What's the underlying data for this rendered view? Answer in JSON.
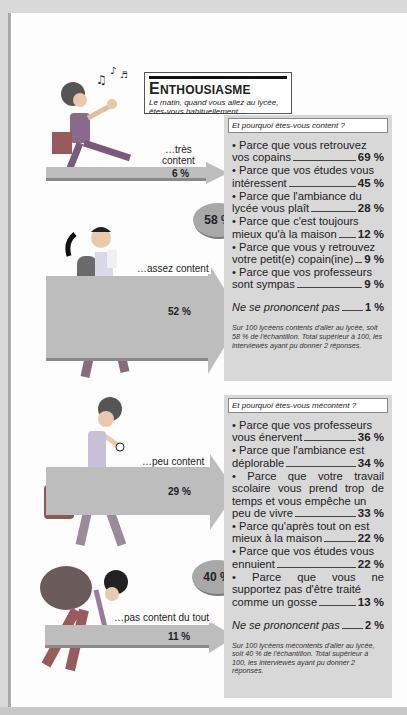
{
  "header": {
    "title_initial": "E",
    "title_rest": "NTHOUSIASME",
    "subtitle": "Le matin, quand vous allez au lycée, êtes-vous habituellement…"
  },
  "categories": [
    {
      "label_line1": "…très",
      "label_line2": "content",
      "pct": "6 %"
    },
    {
      "label": "…assez content",
      "pct": "52 %"
    },
    {
      "label": "…peu content",
      "pct": "29 %"
    },
    {
      "label": "…pas content du tout",
      "pct": "11 %"
    }
  ],
  "bubbles": {
    "content_total": "58 %",
    "mecontent_total": "40 %"
  },
  "content_panel": {
    "question": "Et pourquoi êtes-vous content ?",
    "reasons": [
      {
        "text_a": "• Parce que vous retrouvez",
        "text_b": "vos copains",
        "pct": "69 %"
      },
      {
        "text_a": "• Parce que vos études vous",
        "text_b": "intéressent",
        "pct": "45 %"
      },
      {
        "text_a": "• Parce que l'ambiance du",
        "text_b": "lycée vous plaît",
        "pct": "28 %"
      },
      {
        "text_a": "• Parce que c'est toujours",
        "text_b": "mieux qu'à la maison",
        "pct": "12 %"
      },
      {
        "text_a": "• Parce que vous y retrouvez",
        "text_b": "votre petit(e) copain(ine)",
        "pct": "9 %"
      },
      {
        "text_a": "• Parce que vos professeurs",
        "text_b": "sont sympas",
        "pct": "9 %"
      }
    ],
    "no_response_label": "Ne se prononcent pas",
    "no_response_pct": "1 %",
    "note": "Sur 100 lycéens contents d'aller au lycée, soit 58 % de l'échantillon. Total supérieur à 100, les interviewés ayant pu donner 2 réponses."
  },
  "mecontent_panel": {
    "question": "Et pourquoi êtes-vous mécontent ?",
    "reasons": [
      {
        "text_a": "• Parce que vos professeurs",
        "text_b": "vous énervent",
        "pct": "36 %"
      },
      {
        "text_a": "• Parce que l'ambiance est",
        "text_b": "déplorable",
        "pct": "34 %"
      },
      {
        "text_a": "• Parce que votre travail scolaire vous prend trop de temps et vous empêche un",
        "text_b": "peu de vivre",
        "pct": "33 %"
      },
      {
        "text_a": "• Parce qu'après tout on est",
        "text_b": "mieux à la maison",
        "pct": "22 %"
      },
      {
        "text_a": "• Parce que vos études vous",
        "text_b": "ennuient",
        "pct": "22 %"
      },
      {
        "text_a": "• Parce que vous ne supportez pas d'être traité",
        "text_b": "comme un gosse",
        "pct": "13 %"
      }
    ],
    "no_response_label": "Ne se prononcent pas",
    "no_response_pct": "2 %",
    "note": "Sur 100 lycéens mécontents d'aller au lycée, soit 40 % de l'échantillon. Total supérieur à 100, les interviewés ayant pu donner 2 réponses."
  },
  "colors": {
    "panel_bg": "#d8d8d8",
    "arrow": "#bdbdbd",
    "bubble": "#a8a8a8"
  }
}
